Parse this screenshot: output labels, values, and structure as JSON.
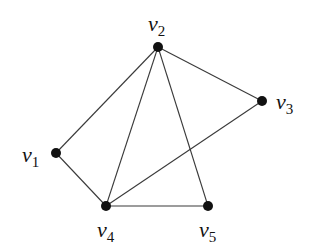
{
  "graph": {
    "nodes": [
      {
        "id": "v1",
        "base": "v",
        "sub": "1",
        "x": 56,
        "y": 153,
        "lx": 22,
        "ly": 162
      },
      {
        "id": "v2",
        "base": "v",
        "sub": "2",
        "x": 158,
        "y": 47,
        "lx": 148,
        "ly": 31
      },
      {
        "id": "v3",
        "base": "v",
        "sub": "3",
        "x": 262,
        "y": 101,
        "lx": 276,
        "ly": 109
      },
      {
        "id": "v4",
        "base": "v",
        "sub": "4",
        "x": 106,
        "y": 206,
        "lx": 97,
        "ly": 237
      },
      {
        "id": "v5",
        "base": "v",
        "sub": "5",
        "x": 208,
        "y": 206,
        "lx": 199,
        "ly": 237
      }
    ],
    "edges": [
      [
        "v1",
        "v2"
      ],
      [
        "v1",
        "v4"
      ],
      [
        "v2",
        "v4"
      ],
      [
        "v2",
        "v5"
      ],
      [
        "v2",
        "v3"
      ],
      [
        "v3",
        "v4"
      ],
      [
        "v4",
        "v5"
      ]
    ],
    "node_radius": 5,
    "edge_color": "#3a3a3a",
    "node_color": "#111111"
  }
}
